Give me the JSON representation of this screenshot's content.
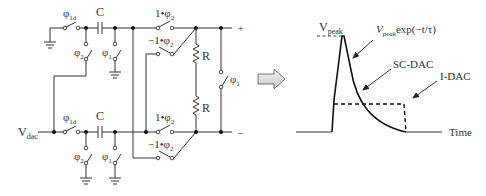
{
  "circuit": {
    "input_label": "V",
    "input_sub": "dac",
    "capacitor_label": "C",
    "resistor_label": "R",
    "switch_labels": {
      "phi1d": {
        "main": "φ",
        "sub": "1d"
      },
      "phi2": {
        "main": "φ",
        "sub": "2"
      },
      "phi1": {
        "main": "φ",
        "sub": "1"
      },
      "pos_phi2": {
        "main": "1•φ",
        "sub": "2"
      },
      "neg_phi2": {
        "main": "−1•φ",
        "sub": "2"
      }
    },
    "output_plus": "+",
    "output_minus": "–"
  },
  "arrow": {
    "icon": "right-arrow-icon"
  },
  "waveform": {
    "vpeak_label": "V",
    "vpeak_sub": "peak",
    "exp_label_main": "V",
    "exp_label_sub": "peak",
    "exp_label_rest": "exp(−t/τ)",
    "sc_dac_label": "SC-DAC",
    "i_dac_label": "I-DAC",
    "time_label": "Time"
  }
}
